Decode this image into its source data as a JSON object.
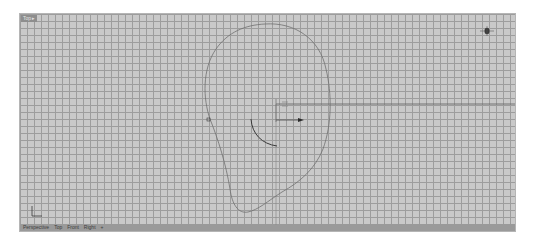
{
  "viewport": {
    "title": "Top",
    "title_caret": "▸",
    "active_view": "Top"
  },
  "tabs": [
    {
      "label": "Perspective"
    },
    {
      "label": "Top"
    },
    {
      "label": "Front"
    },
    {
      "label": "Right"
    },
    {
      "label": "+"
    }
  ],
  "colors": {
    "grid_background": "#c9c9c9",
    "grid_line": "#9d9d9d",
    "axis_line": "#6a6a6a",
    "curve": "#707070",
    "arc": "#3a3a3a",
    "tab_bar": "#9a9a9a"
  },
  "gizmo": {
    "origin_marker_label": "D",
    "axis_arrow": "x-axis-arrow"
  },
  "world_axes": {
    "x_label": "x",
    "y_label": "y"
  }
}
